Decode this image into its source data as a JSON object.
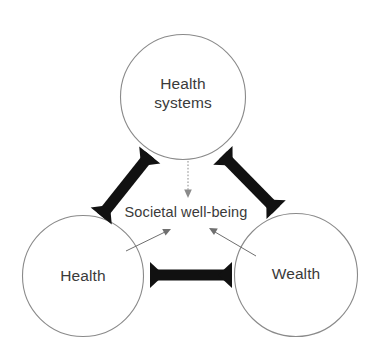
{
  "diagram": {
    "background_color": "#ffffff",
    "circle_stroke_color": "#8a8a8a",
    "text_color": "#3a3a3a",
    "arrow_color": "#111111",
    "thin_arrow_color": "#6f6f6f",
    "nodes": [
      {
        "id": "health-systems",
        "label_line1": "Health",
        "label_line2": "systems",
        "label": "Health systems",
        "cx": 183,
        "cy": 97,
        "r": 63
      },
      {
        "id": "health",
        "label": "Health",
        "cx": 83,
        "cy": 276,
        "r": 61
      },
      {
        "id": "wealth",
        "label": "Wealth",
        "cx": 296,
        "cy": 275,
        "r": 62
      }
    ],
    "center_label": "Societal well-being",
    "connectors": [
      {
        "id": "health-systems-to-health",
        "style": "thick-double-arrow",
        "from": "health-systems",
        "to": "health"
      },
      {
        "id": "health-systems-to-wealth",
        "style": "thick-double-arrow",
        "from": "health-systems",
        "to": "wealth"
      },
      {
        "id": "health-to-wealth",
        "style": "thick-double-arrow",
        "from": "health",
        "to": "wealth"
      },
      {
        "id": "health-systems-to-well-being",
        "style": "dotted-single-arrow",
        "from": "health-systems",
        "to": "center-label"
      },
      {
        "id": "health-to-well-being",
        "style": "thin-single-arrow",
        "from": "health",
        "to": "center-label"
      },
      {
        "id": "wealth-to-well-being",
        "style": "thin-single-arrow",
        "from": "wealth",
        "to": "center-label"
      }
    ]
  }
}
